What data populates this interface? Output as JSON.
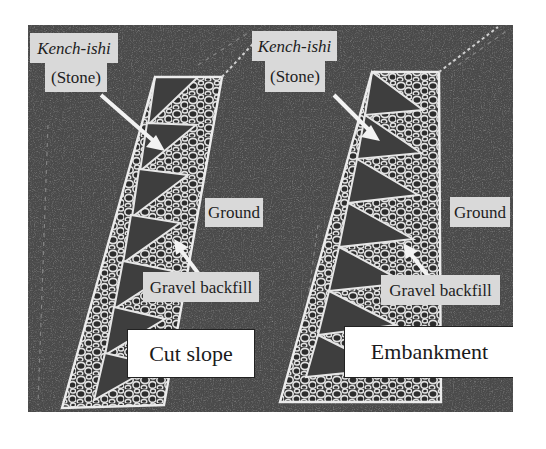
{
  "figure": {
    "panels": [
      {
        "id": "cut-slope",
        "caption": "Cut slope",
        "labels": {
          "stone_name": "Kench-ishi",
          "stone_translation": "(Stone)",
          "ground": "Ground",
          "backfill": "Gravel backfill"
        }
      },
      {
        "id": "embankment",
        "caption": "Embankment",
        "labels": {
          "stone_name": "Kench-ishi",
          "stone_translation": "(Stone)",
          "ground": "Ground",
          "backfill": "Gravel backfill"
        }
      }
    ],
    "colors": {
      "photo_background": "#4a4a4a",
      "wall_lines": "#e6e6e6",
      "label_background": "#d9d9d9",
      "caption_background": "#ffffff",
      "arrow": "#f2f2f2"
    }
  }
}
